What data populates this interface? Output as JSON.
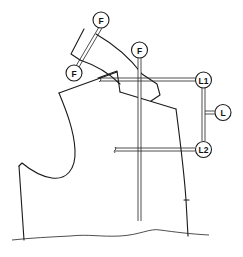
{
  "diagram": {
    "type": "garment-pattern",
    "labels": {
      "f_top": "F",
      "f_left": "F",
      "f_mid": "F",
      "l1": "L1",
      "l": "L",
      "l2": "L2"
    },
    "colors": {
      "line": "#1a1a1a",
      "background": "#ffffff"
    }
  }
}
